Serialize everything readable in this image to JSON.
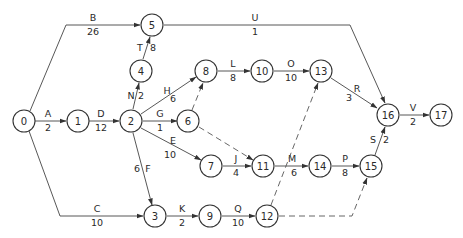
{
  "diagram": {
    "type": "activity-on-arrow network",
    "colors": {
      "line": "#444444",
      "node_stroke": "#333333",
      "text": "#2a2a2a",
      "background": "#ffffff"
    },
    "nodes": [
      {
        "id": "0",
        "x": 24,
        "y": 121
      },
      {
        "id": "1",
        "x": 78,
        "y": 121
      },
      {
        "id": "2",
        "x": 131,
        "y": 121
      },
      {
        "id": "3",
        "x": 155,
        "y": 216
      },
      {
        "id": "4",
        "x": 141,
        "y": 71
      },
      {
        "id": "5",
        "x": 152,
        "y": 25
      },
      {
        "id": "6",
        "x": 188,
        "y": 121
      },
      {
        "id": "7",
        "x": 211,
        "y": 166
      },
      {
        "id": "8",
        "x": 206,
        "y": 71
      },
      {
        "id": "9",
        "x": 210,
        "y": 216
      },
      {
        "id": "10",
        "x": 262,
        "y": 71
      },
      {
        "id": "11",
        "x": 263,
        "y": 166
      },
      {
        "id": "12",
        "x": 267,
        "y": 216
      },
      {
        "id": "13",
        "x": 321,
        "y": 71
      },
      {
        "id": "14",
        "x": 320,
        "y": 166
      },
      {
        "id": "15",
        "x": 371,
        "y": 166
      },
      {
        "id": "16",
        "x": 388,
        "y": 115
      },
      {
        "id": "17",
        "x": 441,
        "y": 115
      }
    ],
    "activities": [
      {
        "name": "A",
        "duration": "2",
        "from": "0",
        "to": "1"
      },
      {
        "name": "B",
        "duration": "26",
        "from": "0",
        "to": "5"
      },
      {
        "name": "C",
        "duration": "10",
        "from": "0",
        "to": "3"
      },
      {
        "name": "D",
        "duration": "12",
        "from": "1",
        "to": "2"
      },
      {
        "name": "E",
        "duration": "10",
        "from": "2",
        "to": "7"
      },
      {
        "name": "F",
        "duration": "6",
        "from": "2",
        "to": "3"
      },
      {
        "name": "G",
        "duration": "1",
        "from": "2",
        "to": "6"
      },
      {
        "name": "H",
        "duration": "6",
        "from": "2",
        "to": "8"
      },
      {
        "name": "N",
        "duration": "2",
        "from": "2",
        "to": "4"
      },
      {
        "name": "T",
        "duration": "8",
        "from": "4",
        "to": "5"
      },
      {
        "name": "U",
        "duration": "1",
        "from": "5",
        "to": "16"
      },
      {
        "name": "L",
        "duration": "8",
        "from": "8",
        "to": "10"
      },
      {
        "name": "O",
        "duration": "10",
        "from": "10",
        "to": "13"
      },
      {
        "name": "R",
        "duration": "3",
        "from": "13",
        "to": "16"
      },
      {
        "name": "J",
        "duration": "4",
        "from": "7",
        "to": "11"
      },
      {
        "name": "M",
        "duration": "6",
        "from": "11",
        "to": "14"
      },
      {
        "name": "P",
        "duration": "8",
        "from": "14",
        "to": "15"
      },
      {
        "name": "S",
        "duration": "2",
        "from": "15",
        "to": "16"
      },
      {
        "name": "K",
        "duration": "2",
        "from": "3",
        "to": "9"
      },
      {
        "name": "Q",
        "duration": "10",
        "from": "9",
        "to": "12"
      },
      {
        "name": "V",
        "duration": "2",
        "from": "16",
        "to": "17"
      }
    ],
    "dummies": [
      {
        "from": "6",
        "to": "8"
      },
      {
        "from": "6",
        "to": "11"
      },
      {
        "from": "12",
        "to": "13"
      },
      {
        "from": "12",
        "to": "15"
      }
    ]
  }
}
